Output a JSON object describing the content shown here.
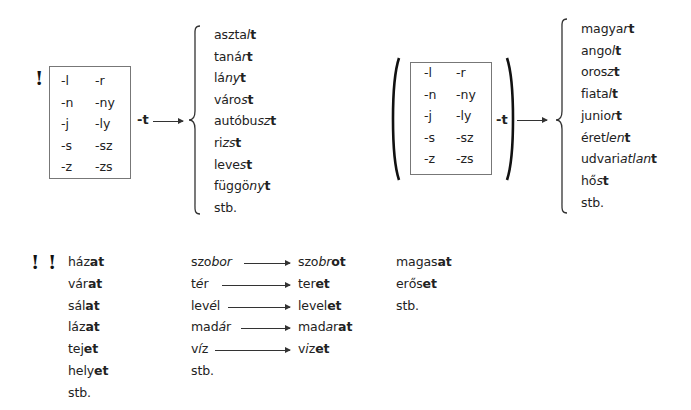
{
  "section1": {
    "marker": "!",
    "suffixes_col1": [
      "-l",
      "-n",
      "-j",
      "-s",
      "-z"
    ],
    "suffixes_col2": [
      "-r",
      "-ny",
      "-ly",
      "-sz",
      "-zs"
    ],
    "ending": "-t",
    "words": [
      {
        "stem": "asztal",
        "stem_italic": "l",
        "end": "t",
        "plain": "aszta"
      },
      {
        "plain": "taná",
        "stem_italic": "r",
        "end": "t"
      },
      {
        "plain": "lá",
        "stem_italic": "ny",
        "end": "t"
      },
      {
        "plain": "váro",
        "stem_italic": "s",
        "end": "t"
      },
      {
        "plain": "autóbu",
        "stem_italic": "sz",
        "end": "t"
      },
      {
        "plain": "ri",
        "stem_italic": "zs",
        "end": "t"
      },
      {
        "plain": "leve",
        "stem_italic": "s",
        "end": "t"
      },
      {
        "plain": "függö",
        "stem_italic": "ny",
        "end": "t"
      },
      {
        "plain": "stb.",
        "stem_italic": "",
        "end": ""
      }
    ]
  },
  "section2": {
    "suffixes_col1": [
      "-l",
      "-n",
      "-j",
      "-s",
      "-z"
    ],
    "suffixes_col2": [
      "-r",
      "-ny",
      "-ly",
      "-sz",
      "-zs"
    ],
    "ending": "-t",
    "words": [
      {
        "plain": "magya",
        "stem_italic": "r",
        "end": "t"
      },
      {
        "plain": "ango",
        "stem_italic": "l",
        "end": "t"
      },
      {
        "plain": "oros",
        "stem_italic": "z",
        "end": "t"
      },
      {
        "plain": "fiata",
        "stem_italic": "l",
        "end": "t"
      },
      {
        "plain": "junio",
        "stem_italic": "r",
        "end": "t"
      },
      {
        "plain": "éret",
        "stem_italic": "len",
        "end": "t"
      },
      {
        "plain": "udvari",
        "stem_italic": "atlan",
        "end": "t"
      },
      {
        "plain": "hő",
        "stem_italic": "s",
        "end": "t"
      },
      {
        "plain": "stb.",
        "stem_italic": "",
        "end": ""
      }
    ]
  },
  "section3": {
    "marker": "! !",
    "col1": [
      {
        "plain": "ház",
        "end": "at"
      },
      {
        "plain": "vár",
        "end": "at"
      },
      {
        "plain": "sál",
        "end": "at"
      },
      {
        "plain": "láz",
        "end": "at"
      },
      {
        "plain": "tej",
        "end": "et"
      },
      {
        "plain": "hely",
        "end": "et"
      },
      {
        "plain": "stb.",
        "end": ""
      }
    ],
    "transforms": [
      {
        "from_plain": "szo",
        "from_italic": "bor",
        "to_plain": "szo",
        "to_italic": "br",
        "to_end": "ot"
      },
      {
        "from_plain": "t",
        "from_italic": "é",
        "from_rest": "r",
        "to_plain": "ter",
        "to_italic": "",
        "to_end": "et"
      },
      {
        "from_plain": "lev",
        "from_italic": "é",
        "from_rest": "l",
        "to_plain": "level",
        "to_italic": "",
        "to_end": "et"
      },
      {
        "from_plain": "mad",
        "from_italic": "á",
        "from_rest": "r",
        "to_plain": "mad",
        "to_italic": "a",
        "to_rest": "r",
        "to_end": "at"
      },
      {
        "from_plain": "v",
        "from_italic": "í",
        "from_rest": "z",
        "to_plain": "v",
        "to_italic": "i",
        "to_rest": "z",
        "to_end": "et"
      }
    ],
    "transforms_etc": "stb.",
    "col3": [
      {
        "plain": "magas",
        "end": "at"
      },
      {
        "plain": "erős",
        "end": "et"
      },
      {
        "plain": "stb.",
        "end": ""
      }
    ]
  }
}
